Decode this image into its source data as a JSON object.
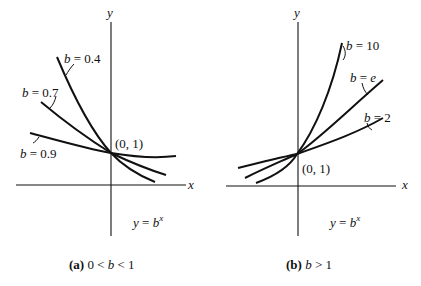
{
  "panels": [
    {
      "id": "a",
      "caption_prefix": "(a)",
      "caption_condition": "0 < b < 1",
      "x_axis_label": "x",
      "y_axis_label": "y",
      "point_label": "(0, 1)",
      "equation_lhs": "y = b",
      "equation_exp": "x",
      "curves": [
        {
          "label": "b = 0.4",
          "b": 0.4
        },
        {
          "label": "b = 0.7",
          "b": 0.7
        },
        {
          "label": "b = 0.9",
          "b": 0.9
        }
      ]
    },
    {
      "id": "b",
      "caption_prefix": "(b)",
      "caption_condition": "b > 1",
      "x_axis_label": "x",
      "y_axis_label": "y",
      "point_label": "(0, 1)",
      "equation_lhs": "y = b",
      "equation_exp": "x",
      "curves": [
        {
          "label": "b = 10",
          "b": 10
        },
        {
          "label": "b = e",
          "b": 2.718
        },
        {
          "label": "b = 2",
          "b": 2
        }
      ]
    }
  ]
}
